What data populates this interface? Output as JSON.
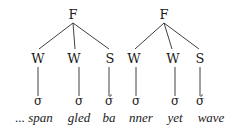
{
  "diagram": {
    "type": "metrical-tree",
    "colors": {
      "ink": "#1a1a1a",
      "background": "#ffffff"
    },
    "feet": [
      {
        "label": "F",
        "pos": {
          "x": 73,
          "y": 18
        },
        "children": [
          {
            "label": "W",
            "x": 38,
            "syllable": "σ",
            "word": "... span"
          },
          {
            "label": "W",
            "x": 74,
            "syllable": "σ",
            "word": "gled"
          },
          {
            "label": "S",
            "x": 110,
            "syllable": "σ́",
            "word": "ba"
          }
        ]
      },
      {
        "label": "F",
        "pos": {
          "x": 164,
          "y": 18
        },
        "children": [
          {
            "label": "W",
            "x": 134,
            "syllable": "σ",
            "word": "nner"
          },
          {
            "label": "W",
            "x": 173,
            "syllable": "σ",
            "word": "yet"
          },
          {
            "label": "S",
            "x": 200,
            "syllable": "σ́",
            "word": "wave"
          }
        ]
      }
    ]
  }
}
